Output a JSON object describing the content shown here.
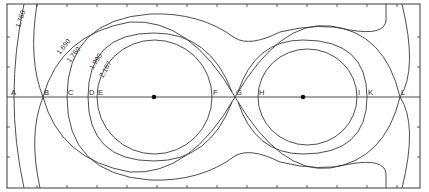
{
  "diagram": {
    "type": "equipotential-contour-plot",
    "colors": {
      "line": "#3a3a3a",
      "background": "#ffffff",
      "text": "#2a2a2a"
    },
    "frame": {
      "x": 7,
      "y": 4,
      "width": 413,
      "height": 184
    },
    "axis_y": 97,
    "centers": [
      {
        "name": "left-center",
        "x": 154,
        "y": 97
      },
      {
        "name": "right-center",
        "x": 303,
        "y": 97
      }
    ],
    "axis_points": [
      {
        "label": "A",
        "x": 10
      },
      {
        "label": "B",
        "x": 43
      },
      {
        "label": "C",
        "x": 67
      },
      {
        "label": "D",
        "x": 88
      },
      {
        "label": "E",
        "x": 97
      },
      {
        "label": "F",
        "x": 212
      },
      {
        "label": "G",
        "x": 235
      },
      {
        "label": "H",
        "x": 258
      },
      {
        "label": "I",
        "x": 357
      },
      {
        "label": "K",
        "x": 367
      },
      {
        "label": "L",
        "x": 400
      }
    ],
    "contour_labels": [
      {
        "text": "1.760",
        "x": 20,
        "y": 28,
        "rotate": -72
      },
      {
        "text": "1.690",
        "x": 60,
        "y": 55,
        "rotate": -52
      },
      {
        "text": "1.760",
        "x": 70,
        "y": 63,
        "rotate": -52
      },
      {
        "text": "1.990",
        "x": 93,
        "y": 70,
        "rotate": -58
      },
      {
        "text": "2.167",
        "x": 103,
        "y": 78,
        "rotate": -60
      }
    ],
    "ticks_horizontal_x": [
      37,
      67,
      97,
      127,
      157,
      187,
      217,
      247,
      277,
      307,
      337,
      367,
      397
    ],
    "ticks_vertical_y": [
      37,
      67,
      127,
      157
    ]
  }
}
